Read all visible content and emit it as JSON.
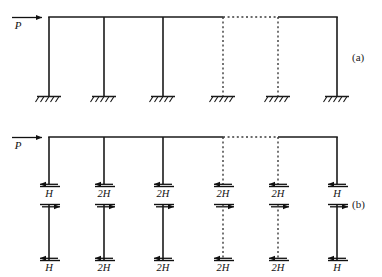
{
  "figure": {
    "background_color": "#ffffff",
    "line_color": "#1a1a1a",
    "dashed_color": "#3a3a3a"
  },
  "panels": [
    {
      "id": "a",
      "label": "(a)",
      "description": "Multi-bay portal frame with fixed bases and lateral load P",
      "applied_load": {
        "symbol": "P",
        "direction": "right"
      },
      "columns": [
        {
          "index": 1,
          "x": 49,
          "style": "solid",
          "support": "fixed"
        },
        {
          "index": 2,
          "x": 104,
          "style": "solid",
          "support": "fixed"
        },
        {
          "index": 3,
          "x": 163,
          "style": "solid",
          "support": "fixed"
        },
        {
          "index": 4,
          "x": 223,
          "style": "dashed",
          "support": "fixed"
        },
        {
          "index": 5,
          "x": 278,
          "style": "dashed",
          "support": "fixed"
        },
        {
          "index": 6,
          "x": 337,
          "style": "solid",
          "support": "fixed"
        }
      ],
      "beam": {
        "y": 17,
        "x_start": 49,
        "x_end": 337,
        "dashed_segment": {
          "x_start": 223,
          "x_end": 278
        }
      },
      "base_y": 96
    },
    {
      "id": "b",
      "label": "(b)",
      "description": "Free-body diagram of the frame cut at column mid-heights showing shear forces",
      "applied_load": {
        "symbol": "P",
        "direction": "right"
      },
      "beam": {
        "y": 137,
        "x_start": 49,
        "x_end": 337,
        "dashed_segment": {
          "x_start": 223,
          "x_end": 278
        }
      },
      "columns": [
        {
          "index": 1,
          "x": 49,
          "style": "solid",
          "shear_label": "H"
        },
        {
          "index": 2,
          "x": 104,
          "style": "solid",
          "shear_label": "2H"
        },
        {
          "index": 3,
          "x": 163,
          "style": "solid",
          "shear_label": "2H"
        },
        {
          "index": 4,
          "x": 223,
          "style": "dashed",
          "shear_label": "2H"
        },
        {
          "index": 5,
          "x": 278,
          "style": "dashed",
          "shear_label": "2H"
        },
        {
          "index": 6,
          "x": 337,
          "style": "solid",
          "shear_label": "H"
        }
      ],
      "cut_upper_y": 186,
      "cut_lower_y": 196,
      "lower_top_y": 206,
      "lower_base_y": 260,
      "upper_shear_direction": "left",
      "lower_top_shear_direction": "right",
      "lower_base_shear_direction": "left",
      "base_shear_labels": [
        "H",
        "2H",
        "2H",
        "2H",
        "2H",
        "H"
      ]
    }
  ]
}
